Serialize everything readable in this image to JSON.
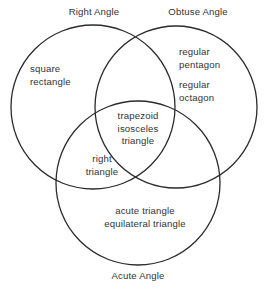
{
  "diagram": {
    "type": "venn",
    "set_count": 3,
    "background_color": "#ffffff",
    "stroke_color": "#2b2b2b",
    "text_color": "#333333",
    "set_labels": {
      "right_angle": "Right Angle",
      "obtuse_angle": "Obtuse Angle",
      "acute_angle": "Acute Angle"
    },
    "regions": {
      "right_only": {
        "line1": "square",
        "line2": "rectangle"
      },
      "obtuse_only": {
        "line1": "regular",
        "line2": "pentagon",
        "line3": "regular",
        "line4": "octagon"
      },
      "triple_intersection": {
        "line1": "trapezoid",
        "line2": "isosceles",
        "line3": "triangle"
      },
      "right_and_acute": {
        "line1": "right",
        "line2": "triangle"
      },
      "acute_only": {
        "line1": "acute triangle",
        "line2": "equilateral triangle"
      }
    }
  }
}
